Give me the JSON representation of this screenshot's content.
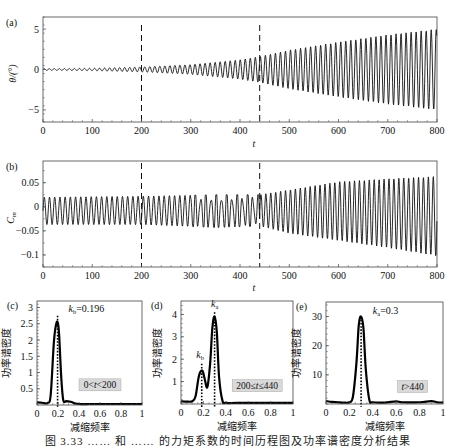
{
  "figure": {
    "caption": "图 3.33   ……   和   ……   的力矩系数的时间历程图及功率谱密度分析结果"
  },
  "chart_data": [
    {
      "id": "a",
      "panel_label": "(a)",
      "type": "line",
      "title": "",
      "xlabel": "t",
      "ylabel": "θ/(°)",
      "xlim": [
        0,
        800
      ],
      "ylim": [
        -6.5,
        6.5
      ],
      "xticks": [
        0,
        100,
        200,
        300,
        400,
        500,
        600,
        700,
        800
      ],
      "yticks": [
        -5,
        0,
        5
      ],
      "grid": false,
      "vlines_dashed": [
        200,
        440
      ],
      "description": "Growing sinusoidal oscillation; amplitude envelope vs t",
      "envelope": {
        "t": [
          0,
          100,
          200,
          300,
          400,
          440,
          500,
          600,
          700,
          800
        ],
        "amplitude": [
          0.1,
          0.15,
          0.3,
          0.6,
          1.2,
          1.6,
          2.4,
          3.4,
          4.3,
          5.0
        ]
      },
      "reduced_frequency": 0.3
    },
    {
      "id": "b",
      "panel_label": "(b)",
      "type": "line",
      "title": "",
      "xlabel": "t",
      "ylabel": "C_m",
      "xlim": [
        0,
        800
      ],
      "ylim": [
        -0.125,
        0.095
      ],
      "xticks": [
        0,
        100,
        200,
        300,
        400,
        500,
        600,
        700,
        800
      ],
      "yticks": [
        -0.1,
        -0.05,
        0,
        0.05
      ],
      "ytick_labels": [
        "−0.1",
        "−0.05",
        "0",
        "0.05"
      ],
      "grid": false,
      "vlines_dashed": [
        200,
        440
      ],
      "description": "Moment coefficient: steady oscillation ~[-0.037,0.02] until t≈440, then growing to ~[-0.1,0.063]",
      "envelope": {
        "t": [
          0,
          200,
          350,
          440,
          500,
          600,
          700,
          800
        ],
        "upper": [
          0.02,
          0.022,
          0.025,
          0.025,
          0.035,
          0.052,
          0.058,
          0.063
        ],
        "lower": [
          -0.037,
          -0.037,
          -0.043,
          -0.04,
          -0.055,
          -0.07,
          -0.085,
          -0.102
        ]
      }
    },
    {
      "id": "c",
      "panel_label": "(c)",
      "type": "line",
      "xlabel": "减缩频率",
      "ylabel": "功率谱密度",
      "xlim": [
        0,
        1
      ],
      "ylim": [
        0,
        3.2
      ],
      "xticks": [
        0,
        0.2,
        0.4,
        0.6,
        0.8,
        1
      ],
      "xtick_labels": [
        "0",
        "0.2",
        "0.4",
        "0.6",
        "0.8",
        "1"
      ],
      "yticks": [
        0.5,
        1,
        1.5,
        2,
        2.5,
        3
      ],
      "ytick_labels": [
        "0.5",
        "1",
        "1.5",
        "2",
        "2.5",
        "3"
      ],
      "x": [
        0,
        0.05,
        0.1,
        0.13,
        0.16,
        0.18,
        0.196,
        0.21,
        0.23,
        0.25,
        0.28,
        0.32,
        0.36,
        0.4,
        0.5,
        0.6,
        0.8,
        1.0
      ],
      "y": [
        0.08,
        0.07,
        0.06,
        0.3,
        1.9,
        2.45,
        2.55,
        2.2,
        0.9,
        0.15,
        0.12,
        0.1,
        0.05,
        0.03,
        0.03,
        0.03,
        0.03,
        0.03
      ],
      "dotted_vlines": [
        {
          "x": 0.196,
          "y": 2.75
        }
      ],
      "annotation": {
        "label_k": "k",
        "label_sub": "b",
        "label_val": "=0.196",
        "x": 0.3,
        "y": 2.85
      },
      "range_label": "0<t<200",
      "range_label_pos": {
        "x": 0.6,
        "y": 0.62
      }
    },
    {
      "id": "d",
      "panel_label": "(d)",
      "type": "line",
      "xlabel": "减缩频率",
      "ylabel": "功率谱密度",
      "xlim": [
        0,
        1
      ],
      "ylim": [
        0,
        4.6
      ],
      "xticks": [
        0,
        0.2,
        0.4,
        0.6,
        0.8,
        1
      ],
      "xtick_labels": [
        "0",
        "0.2",
        "0.4",
        "0.6",
        "0.8",
        "1"
      ],
      "yticks": [
        1,
        2,
        3,
        4
      ],
      "ytick_labels": [
        "1",
        "2",
        "3",
        "4"
      ],
      "x": [
        0,
        0.05,
        0.1,
        0.13,
        0.16,
        0.19,
        0.21,
        0.235,
        0.26,
        0.28,
        0.3,
        0.32,
        0.34,
        0.37,
        0.4,
        0.5,
        0.7,
        1.0
      ],
      "y": [
        0.12,
        0.11,
        0.12,
        0.35,
        1.25,
        1.5,
        1.15,
        0.75,
        1.8,
        3.4,
        3.9,
        3.2,
        1.2,
        0.15,
        0.05,
        0.05,
        0.05,
        0.05
      ],
      "dotted_vlines": [
        {
          "x": 0.185,
          "y": 1.8
        },
        {
          "x": 0.3,
          "y": 4.1
        }
      ],
      "annotations": [
        {
          "label_k": "k",
          "label_sub": "b",
          "x": 0.17,
          "y": 2.05
        },
        {
          "label_k": "k",
          "label_sub": "a",
          "x": 0.3,
          "y": 4.35
        }
      ],
      "range_label": "200≤t≤440",
      "range_label_pos": {
        "x": 0.68,
        "y": 0.82
      }
    },
    {
      "id": "e",
      "panel_label": "(e)",
      "type": "line",
      "xlabel": "减缩频率",
      "ylabel": "功率谱密度",
      "xlim": [
        0,
        1
      ],
      "ylim": [
        0,
        35
      ],
      "xticks": [
        0,
        0.2,
        0.4,
        0.6,
        0.8,
        1
      ],
      "xtick_labels": [
        "0",
        "0.2",
        "0.4",
        "0.6",
        "0.8",
        "1"
      ],
      "yticks": [
        10,
        20,
        30
      ],
      "ytick_labels": [
        "10",
        "20",
        "30"
      ],
      "x": [
        0,
        0.05,
        0.1,
        0.15,
        0.2,
        0.23,
        0.26,
        0.28,
        0.3,
        0.32,
        0.34,
        0.37,
        0.4,
        0.5,
        0.6,
        0.65,
        0.8,
        0.9,
        0.95,
        1.0
      ],
      "y": [
        1.0,
        0.7,
        0.6,
        0.5,
        0.6,
        2.5,
        14,
        27,
        30,
        26,
        12,
        1.5,
        0.6,
        0.5,
        0.9,
        0.6,
        0.6,
        1.0,
        0.6,
        0.5
      ],
      "dotted_vlines": [
        {
          "x": 0.3,
          "y": 30
        }
      ],
      "annotation": {
        "label_k": "k",
        "label_sub": "a",
        "label_val": "=0.3",
        "x": 0.4,
        "y": 31
      },
      "range_label": "t>440",
      "range_label_pos": {
        "x": 0.74,
        "y": 6
      }
    }
  ],
  "layout": {
    "panels": {
      "a": {
        "left": 43,
        "right": 437,
        "top": 17,
        "bottom": 122
      },
      "b": {
        "left": 43,
        "right": 437,
        "top": 161,
        "bottom": 267
      },
      "c": {
        "left": 37,
        "right": 142,
        "top": 301,
        "bottom": 405
      },
      "d": {
        "left": 181,
        "right": 293,
        "top": 301,
        "bottom": 404
      },
      "e": {
        "left": 326,
        "right": 443,
        "top": 302,
        "bottom": 404
      }
    }
  }
}
